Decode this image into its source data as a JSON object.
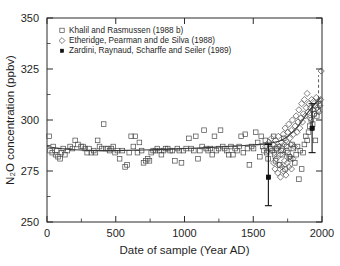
{
  "chart_data": {
    "type": "scatter",
    "title": "",
    "xlabel": "Date of sample (Year AD)",
    "ylabel": "N₂O concentration (ppbv)",
    "xlim": [
      0,
      2000
    ],
    "ylim": [
      250,
      350
    ],
    "xticks": [
      0,
      500,
      1000,
      1500,
      2000
    ],
    "yticks": [
      250,
      275,
      300,
      325,
      350
    ],
    "xtick_labels": [
      "0",
      "500",
      "1000",
      "1500",
      "2000"
    ],
    "ytick_labels": [
      "250",
      "275",
      "300",
      "325",
      "350"
    ],
    "x_minor_interval": 250,
    "y_minor_interval": 12.5,
    "grid": false,
    "legend_position": "top-left",
    "legend": [
      {
        "label": "Khalil and Rasmussen (1988 b)",
        "marker": "open-square"
      },
      {
        "label": "Etheridge, Pearman and de Silva (1988)",
        "marker": "open-diamond"
      },
      {
        "label": "Zardini, Raynaud, Scharffe and Seiler (1989)",
        "marker": "filled-square"
      }
    ],
    "series": [
      {
        "name": "Khalil and Rasmussen (1988 b)",
        "marker": "open-square",
        "points": [
          [
            15,
            292
          ],
          [
            22,
            285
          ],
          [
            38,
            284
          ],
          [
            45,
            287
          ],
          [
            62,
            283
          ],
          [
            70,
            285
          ],
          [
            80,
            282
          ],
          [
            95,
            281
          ],
          [
            105,
            284
          ],
          [
            118,
            286
          ],
          [
            130,
            283
          ],
          [
            148,
            285
          ],
          [
            168,
            287
          ],
          [
            185,
            286
          ],
          [
            205,
            290
          ],
          [
            225,
            288
          ],
          [
            248,
            287
          ],
          [
            262,
            287
          ],
          [
            278,
            286
          ],
          [
            292,
            284
          ],
          [
            305,
            286
          ],
          [
            322,
            284
          ],
          [
            340,
            285
          ],
          [
            352,
            284
          ],
          [
            368,
            290
          ],
          [
            382,
            287
          ],
          [
            398,
            286
          ],
          [
            412,
            298
          ],
          [
            428,
            286
          ],
          [
            442,
            286
          ],
          [
            455,
            285
          ],
          [
            468,
            286
          ],
          [
            482,
            287
          ],
          [
            495,
            284
          ],
          [
            512,
            285
          ],
          [
            528,
            281
          ],
          [
            548,
            285
          ],
          [
            568,
            277
          ],
          [
            582,
            278
          ],
          [
            598,
            284
          ],
          [
            612,
            292
          ],
          [
            628,
            287
          ],
          [
            642,
            292
          ],
          [
            658,
            284
          ],
          [
            672,
            289
          ],
          [
            688,
            285
          ],
          [
            702,
            279
          ],
          [
            718,
            280
          ],
          [
            732,
            281
          ],
          [
            745,
            280
          ],
          [
            758,
            284
          ],
          [
            772,
            285
          ],
          [
            788,
            285
          ],
          [
            802,
            286
          ],
          [
            818,
            285
          ],
          [
            832,
            283
          ],
          [
            848,
            285
          ],
          [
            862,
            286
          ],
          [
            878,
            286
          ],
          [
            895,
            285
          ],
          [
            912,
            285
          ],
          [
            930,
            280
          ],
          [
            948,
            286
          ],
          [
            962,
            285
          ],
          [
            978,
            279
          ],
          [
            992,
            285
          ],
          [
            1012,
            286
          ],
          [
            1032,
            291
          ],
          [
            1048,
            286
          ],
          [
            1068,
            285
          ],
          [
            1082,
            292
          ],
          [
            1098,
            281
          ],
          [
            1112,
            285
          ],
          [
            1128,
            287
          ],
          [
            1142,
            295
          ],
          [
            1158,
            286
          ],
          [
            1172,
            285
          ],
          [
            1188,
            286
          ],
          [
            1202,
            283
          ],
          [
            1218,
            292
          ],
          [
            1232,
            285
          ],
          [
            1248,
            286
          ],
          [
            1262,
            295
          ],
          [
            1278,
            287
          ],
          [
            1292,
            286
          ],
          [
            1308,
            285
          ],
          [
            1322,
            283
          ],
          [
            1338,
            287
          ],
          [
            1352,
            283
          ],
          [
            1368,
            286
          ],
          [
            1382,
            285
          ],
          [
            1398,
            287
          ],
          [
            1412,
            292
          ],
          [
            1428,
            284
          ],
          [
            1442,
            293
          ],
          [
            1458,
            286
          ],
          [
            1472,
            278
          ],
          [
            1488,
            287
          ],
          [
            1502,
            286
          ],
          [
            1518,
            294
          ],
          [
            1532,
            289
          ],
          [
            1548,
            282
          ],
          [
            1558,
            292
          ],
          [
            1568,
            287
          ],
          [
            1578,
            285
          ],
          [
            1588,
            290
          ],
          [
            1598,
            284
          ],
          [
            1608,
            281
          ],
          [
            1618,
            288
          ],
          [
            1628,
            286
          ],
          [
            1638,
            285
          ],
          [
            1648,
            292
          ],
          [
            1655,
            283
          ],
          [
            1662,
            280
          ],
          [
            1672,
            286
          ],
          [
            1682,
            287
          ],
          [
            1692,
            278
          ],
          [
            1702,
            285
          ],
          [
            1712,
            283
          ],
          [
            1722,
            291
          ],
          [
            1732,
            276
          ],
          [
            1742,
            287
          ],
          [
            1752,
            284
          ],
          [
            1762,
            282
          ],
          [
            1772,
            281
          ],
          [
            1782,
            288
          ],
          [
            1792,
            286
          ],
          [
            1802,
            279
          ],
          [
            1812,
            283
          ],
          [
            1822,
            287
          ],
          [
            1832,
            271
          ],
          [
            1842,
            285
          ],
          [
            1852,
            276
          ],
          [
            1862,
            284
          ],
          [
            1872,
            288
          ],
          [
            1882,
            292
          ],
          [
            1892,
            290
          ],
          [
            1902,
            294
          ],
          [
            1912,
            297
          ],
          [
            1922,
            300
          ],
          [
            1932,
            298
          ],
          [
            1942,
            303
          ],
          [
            1952,
            290
          ],
          [
            1962,
            302
          ],
          [
            1972,
            305
          ],
          [
            1982,
            308
          ]
        ]
      },
      {
        "name": "Etheridge, Pearman and de Silva (1988)",
        "marker": "open-diamond",
        "points": [
          [
            1592,
            287
          ],
          [
            1602,
            285
          ],
          [
            1612,
            289
          ],
          [
            1622,
            286
          ],
          [
            1632,
            291
          ],
          [
            1642,
            288
          ],
          [
            1652,
            284
          ],
          [
            1662,
            290
          ],
          [
            1672,
            286
          ],
          [
            1682,
            292
          ],
          [
            1692,
            287
          ],
          [
            1698,
            283
          ],
          [
            1705,
            289
          ],
          [
            1712,
            286
          ],
          [
            1718,
            293
          ],
          [
            1725,
            288
          ],
          [
            1732,
            296
          ],
          [
            1738,
            290
          ],
          [
            1745,
            285
          ],
          [
            1752,
            294
          ],
          [
            1758,
            298
          ],
          [
            1765,
            291
          ],
          [
            1772,
            288
          ],
          [
            1778,
            295
          ],
          [
            1785,
            300
          ],
          [
            1792,
            293
          ],
          [
            1798,
            287
          ],
          [
            1805,
            297
          ],
          [
            1812,
            302
          ],
          [
            1818,
            294
          ],
          [
            1825,
            299
          ],
          [
            1832,
            305
          ],
          [
            1838,
            296
          ],
          [
            1845,
            301
          ],
          [
            1852,
            308
          ],
          [
            1858,
            299
          ],
          [
            1865,
            303
          ],
          [
            1872,
            310
          ],
          [
            1878,
            302
          ],
          [
            1885,
            306
          ],
          [
            1892,
            313
          ],
          [
            1898,
            304
          ],
          [
            1905,
            308
          ],
          [
            1912,
            301
          ],
          [
            1918,
            306
          ],
          [
            1925,
            310
          ],
          [
            1932,
            305
          ],
          [
            1938,
            309
          ],
          [
            1945,
            303
          ],
          [
            1952,
            307
          ],
          [
            1958,
            311
          ],
          [
            1965,
            306
          ],
          [
            1972,
            309
          ],
          [
            1978,
            304
          ],
          [
            1985,
            307
          ],
          [
            1990,
            310
          ],
          [
            1994,
            324
          ],
          [
            1648,
            279
          ],
          [
            1658,
            276
          ],
          [
            1668,
            281
          ],
          [
            1678,
            274
          ],
          [
            1688,
            278
          ],
          [
            1698,
            272
          ],
          [
            1708,
            277
          ],
          [
            1718,
            275
          ],
          [
            1728,
            280
          ],
          [
            1738,
            273
          ],
          [
            1748,
            279
          ],
          [
            1758,
            277
          ],
          [
            1768,
            282
          ],
          [
            1778,
            276
          ],
          [
            1788,
            281
          ]
        ]
      },
      {
        "name": "Zardini, Raynaud, Scharffe and Seiler (1989)",
        "marker": "filled-square",
        "points": [
          [
            1610,
            272
          ],
          [
            1928,
            296
          ]
        ],
        "error_bars": [
          {
            "x": 1610,
            "y": 272,
            "low": 258,
            "high": 288
          },
          {
            "x": 1928,
            "y": 296,
            "low": 284,
            "high": 308
          }
        ]
      }
    ],
    "trend_line": {
      "name": "smoothed fit",
      "points": [
        [
          0,
          287
        ],
        [
          100,
          286
        ],
        [
          200,
          285.4
        ],
        [
          300,
          285.1
        ],
        [
          400,
          285
        ],
        [
          500,
          285
        ],
        [
          600,
          285.2
        ],
        [
          700,
          285.3
        ],
        [
          800,
          285.5
        ],
        [
          900,
          285.7
        ],
        [
          1000,
          286
        ],
        [
          1100,
          286.3
        ],
        [
          1200,
          286.6
        ],
        [
          1300,
          287
        ],
        [
          1400,
          287.4
        ],
        [
          1500,
          287.8
        ],
        [
          1600,
          288.4
        ],
        [
          1650,
          289
        ],
        [
          1700,
          290
        ],
        [
          1750,
          292
        ],
        [
          1800,
          295
        ],
        [
          1850,
          299
        ],
        [
          1900,
          304
        ],
        [
          1950,
          308
        ],
        [
          1990,
          311
        ]
      ]
    },
    "annotations": [
      {
        "type": "dashed-vertical-line",
        "x": 1975,
        "y_from": 305,
        "y_to": 322
      }
    ]
  },
  "colors": {
    "background": "#ffffff",
    "axis": "#2b2b2b",
    "marker_open": "#4a4a4a",
    "marker_filled": "#111111",
    "trend": "#3a3a3a"
  }
}
